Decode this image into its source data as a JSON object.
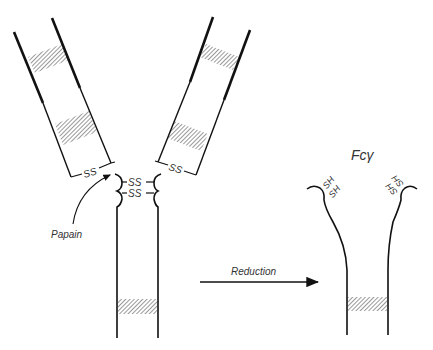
{
  "diagram": {
    "type": "antibody-fragmentation",
    "labels": {
      "papain": "Papain",
      "reduction": "Reduction",
      "fc_gamma": "Fcγ",
      "ss_left_arm": "SS",
      "ss_right_arm": "SS",
      "ss_hinge_1": "SS",
      "ss_hinge_2": "SS",
      "sh_left_1": "SH",
      "sh_left_2": "SH",
      "sh_right_1": "SH",
      "sh_right_2": "SH"
    },
    "colors": {
      "line": "#111111",
      "hatch": "#555555",
      "text": "#333333"
    }
  }
}
